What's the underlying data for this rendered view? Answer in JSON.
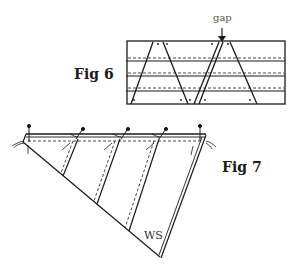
{
  "figures": [
    {
      "id": "fig6",
      "label": "Fig 6",
      "annotation": "gap"
    },
    {
      "id": "fig7",
      "label": "Fig 7",
      "annotation": "WS"
    }
  ],
  "colors": {
    "line": "#1a1a1a",
    "background": "#ffffff"
  }
}
